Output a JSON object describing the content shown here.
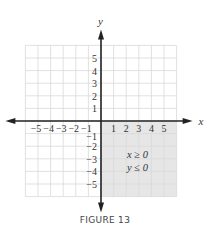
{
  "caption": "FIGURE 13",
  "chart_data": {
    "type": "region",
    "title": "",
    "xlabel": "x",
    "ylabel": "y",
    "xlim": [
      -6,
      6
    ],
    "ylim": [
      -6,
      6
    ],
    "grid": true,
    "x_ticks": [
      -5,
      -4,
      -3,
      -2,
      -1,
      1,
      2,
      3,
      4,
      5
    ],
    "y_ticks": [
      5,
      4,
      3,
      2,
      1,
      -1,
      -2,
      -3,
      -4,
      -5
    ],
    "shaded_region": {
      "x_range": [
        0,
        6
      ],
      "y_range": [
        -6,
        0
      ],
      "color": "#e6e6e6"
    },
    "annotations": [
      "x ≥ 0",
      "y ≤ 0"
    ],
    "inequalities": [
      "x ≥ 0",
      "y ≤ 0"
    ]
  },
  "colors": {
    "grid": "#d9d9d9",
    "axis": "#222222",
    "shade": "#e6e6e6",
    "text": "#333333"
  }
}
